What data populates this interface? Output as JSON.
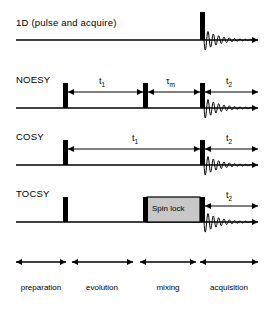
{
  "figure": {
    "type": "nmr-pulse-sequence-diagram",
    "background": "#ffffff",
    "ink": "#000000",
    "spinlock_fill": "#c8c8c8"
  },
  "sequences": [
    {
      "name": "1D (pulse and acquire)",
      "label_x": 16,
      "label_y": 17,
      "baseline_y": 40,
      "baseline_x1": 16,
      "baseline_x2": 258,
      "pulses": [
        {
          "x": 200,
          "width": 5,
          "height": 28
        }
      ],
      "fid": {
        "start_x": 204,
        "end_x": 258,
        "amplitude": 11
      },
      "intervals": []
    },
    {
      "name": "NOESY",
      "label_x": 16,
      "label_y": 74,
      "baseline_y": 108,
      "baseline_x1": 16,
      "baseline_x2": 258,
      "pulses": [
        {
          "x": 63,
          "width": 5,
          "height": 25
        },
        {
          "x": 143,
          "width": 5,
          "height": 25
        },
        {
          "x": 200,
          "width": 5,
          "height": 25
        }
      ],
      "fid": {
        "start_x": 204,
        "end_x": 258,
        "amplitude": 11
      },
      "intervals": [
        {
          "label": "t",
          "sub": "1",
          "x1": 68,
          "x2": 143,
          "y": 92,
          "label_x": 99,
          "label_y": 76
        },
        {
          "label": "τ",
          "sub": "m",
          "x1": 148,
          "x2": 200,
          "y": 92,
          "label_x": 166,
          "label_y": 76
        },
        {
          "label": "t",
          "sub": "2",
          "x1": 205,
          "x2": 258,
          "y": 92,
          "label_x": 226,
          "label_y": 76
        }
      ]
    },
    {
      "name": "COSY",
      "label_x": 16,
      "label_y": 131,
      "baseline_y": 165,
      "baseline_x1": 16,
      "baseline_x2": 258,
      "pulses": [
        {
          "x": 63,
          "width": 5,
          "height": 25
        },
        {
          "x": 200,
          "width": 5,
          "height": 25
        }
      ],
      "fid": {
        "start_x": 204,
        "end_x": 258,
        "amplitude": 11
      },
      "intervals": [
        {
          "label": "t",
          "sub": "1",
          "x1": 68,
          "x2": 200,
          "y": 149,
          "label_x": 132,
          "label_y": 133
        },
        {
          "label": "t",
          "sub": "2",
          "x1": 205,
          "x2": 258,
          "y": 149,
          "label_x": 226,
          "label_y": 133
        }
      ]
    },
    {
      "name": "TOCSY",
      "label_x": 16,
      "label_y": 188,
      "baseline_y": 222,
      "baseline_x1": 16,
      "baseline_x2": 258,
      "pulses": [
        {
          "x": 63,
          "width": 5,
          "height": 25
        },
        {
          "x": 143,
          "width": 5,
          "height": 25
        },
        {
          "x": 200,
          "width": 5,
          "height": 25
        }
      ],
      "fid": {
        "start_x": 204,
        "end_x": 258,
        "amplitude": 11
      },
      "spinlock": {
        "text": "Spin lock",
        "x1": 147,
        "x2": 200,
        "y": 197,
        "height": 25,
        "text_x": 152,
        "text_y": 204
      },
      "intervals": [
        {
          "label": "t",
          "sub": "2",
          "x1": 205,
          "x2": 258,
          "y": 206,
          "label_x": 226,
          "label_y": 190
        }
      ]
    }
  ],
  "phases": [
    {
      "label": "preparation",
      "x1": 16,
      "x2": 66,
      "arrow_y": 262,
      "label_x": 41,
      "label_y": 283
    },
    {
      "label": "evolution",
      "x1": 72,
      "x2": 133,
      "arrow_y": 262,
      "label_x": 102,
      "label_y": 283
    },
    {
      "label": "mixing",
      "x1": 140,
      "x2": 196,
      "arrow_y": 262,
      "label_x": 168,
      "label_y": 283
    },
    {
      "label": "acquisition",
      "x1": 200,
      "x2": 258,
      "arrow_y": 262,
      "label_x": 229,
      "label_y": 283
    }
  ]
}
